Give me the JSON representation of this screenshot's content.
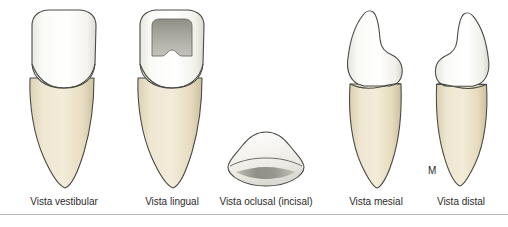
{
  "figure": {
    "background_color": "#ffffff",
    "rule_color": "#b9b9b9"
  },
  "palette": {
    "enamel_light": "#ffffff",
    "enamel_shade": "#f2f1ec",
    "dentin_root": "#ece3cc",
    "root_shade": "#ded2b4",
    "fossa_gray": "#9a9a93",
    "outline": "#4a4a46",
    "label_text": "#2b2b2b"
  },
  "views": [
    {
      "id": "vestibular",
      "caption": "Vista vestibular",
      "icon": "tooth-vestibular-icon"
    },
    {
      "id": "lingual",
      "caption": "Vista lingual",
      "icon": "tooth-lingual-icon"
    },
    {
      "id": "oclusal",
      "caption": "Vista oclusal (incisal)",
      "icon": "tooth-occlusal-icon",
      "annotations": [
        {
          "id": "mesial-marker",
          "label": "M",
          "meaning": "mesial"
        },
        {
          "id": "distal-marker",
          "label": "D",
          "meaning": "distal"
        }
      ]
    },
    {
      "id": "mesial",
      "caption": "Vista mesial",
      "icon": "tooth-mesial-icon"
    },
    {
      "id": "distal",
      "caption": "Vista distal",
      "icon": "tooth-distal-icon"
    }
  ]
}
